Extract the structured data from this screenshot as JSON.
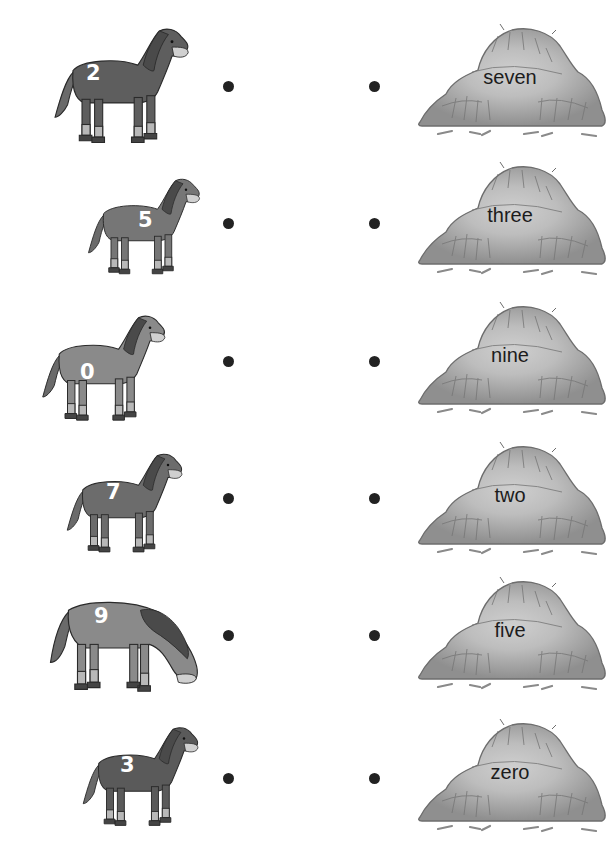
{
  "worksheet": {
    "task": "match-horse-number-to-hay-word",
    "colors": {
      "dot": "#222222",
      "horse_dark": "#5a5a5a",
      "horse_medium": "#7a7a7a",
      "horse_light": "#9a9a9a",
      "mane": "#4a4a4a",
      "hay": "#a8a8a8",
      "hay_center": "#c8c8c8",
      "number_text": "#ffffff",
      "word_text": "#1c1c1c"
    },
    "horses": [
      {
        "number": "2",
        "pose": "standing-facing-right"
      },
      {
        "number": "5",
        "pose": "looking-back-leg-raised"
      },
      {
        "number": "0",
        "pose": "standing-facing-right"
      },
      {
        "number": "7",
        "pose": "walking"
      },
      {
        "number": "9",
        "pose": "grazing-head-down"
      },
      {
        "number": "3",
        "pose": "standing-facing-right"
      }
    ],
    "hay_piles": [
      {
        "word": "seven"
      },
      {
        "word": "three"
      },
      {
        "word": "nine"
      },
      {
        "word": "two"
      },
      {
        "word": "five"
      },
      {
        "word": "zero"
      }
    ],
    "left_dots_count": 6,
    "right_dots_count": 6
  }
}
